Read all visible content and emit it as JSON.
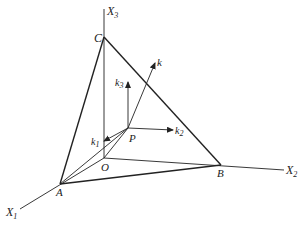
{
  "diagram": {
    "type": "3d-coordinate-figure",
    "axes": [
      {
        "id": "x1",
        "label": "X",
        "subscript": "1"
      },
      {
        "id": "x2",
        "label": "X",
        "subscript": "2"
      },
      {
        "id": "x3",
        "label": "X",
        "subscript": "3"
      }
    ],
    "points": [
      {
        "id": "O",
        "label": "O"
      },
      {
        "id": "A",
        "label": "A"
      },
      {
        "id": "B",
        "label": "B"
      },
      {
        "id": "C",
        "label": "C"
      },
      {
        "id": "P",
        "label": "P"
      }
    ],
    "vectors": [
      {
        "id": "k",
        "label": "k",
        "subscript": ""
      },
      {
        "id": "k1",
        "label": "k",
        "subscript": "1"
      },
      {
        "id": "k2",
        "label": "k",
        "subscript": "2"
      },
      {
        "id": "k3",
        "label": "k",
        "subscript": "3"
      }
    ],
    "line_color": "#222222",
    "background": "#ffffff"
  }
}
